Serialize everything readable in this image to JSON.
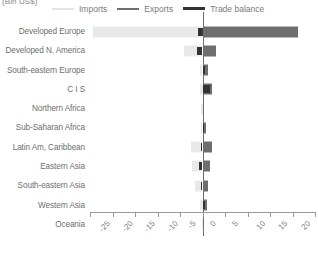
{
  "unit_label": "(Bln US$)",
  "legend": {
    "items": [
      {
        "label": "Imports",
        "color": "#e9e9e9",
        "icon": "line-swatch-icon"
      },
      {
        "label": "Exports",
        "color": "#6e6e6e",
        "icon": "line-swatch-icon"
      },
      {
        "label": "Trade balance",
        "color": "#333333",
        "icon": "line-swatch-icon"
      }
    ]
  },
  "chart_data": {
    "type": "bar",
    "orientation": "horizontal",
    "title": "",
    "subtitle": "",
    "xlabel": "(Bln US$)",
    "ylabel": "",
    "xlim": [
      -25,
      25
    ],
    "xticks": [
      -25,
      -20,
      -15,
      -10,
      -5,
      0,
      5,
      10,
      15,
      20,
      25
    ],
    "xtick_labels": [
      "-25",
      "-20",
      "-15",
      "-10",
      "-5",
      "0",
      "5",
      "10",
      "15",
      "20",
      "25"
    ],
    "grid": false,
    "legend_position": "top",
    "categories": [
      "Developed Europe",
      "Developed N. America",
      "South-eastern Europe",
      "C I S",
      "Northern Africa",
      "Sub-Saharan Africa",
      "Latin Am, Caribbean",
      "Eastern Asia",
      "South-eastern Asia",
      "Western Asia",
      "Oceania"
    ],
    "series": [
      {
        "name": "Imports",
        "color": "#e9e9e9",
        "values": [
          -24.3,
          -4.2,
          -0.6,
          -0.5,
          -0.3,
          -0.4,
          -2.6,
          -2.4,
          -1.6,
          -0.5,
          -0.1
        ]
      },
      {
        "name": "Exports",
        "color": "#6e6e6e",
        "values": [
          21.3,
          3.0,
          1.2,
          2.1,
          0.3,
          0.7,
          2.2,
          1.7,
          1.2,
          1.0,
          0.1
        ]
      },
      {
        "name": "Trade balance",
        "color": "#333333",
        "values": [
          -1.0,
          -1.2,
          0.6,
          1.6,
          0.0,
          0.3,
          -0.4,
          -0.7,
          -0.4,
          0.5,
          0.0
        ]
      }
    ]
  }
}
